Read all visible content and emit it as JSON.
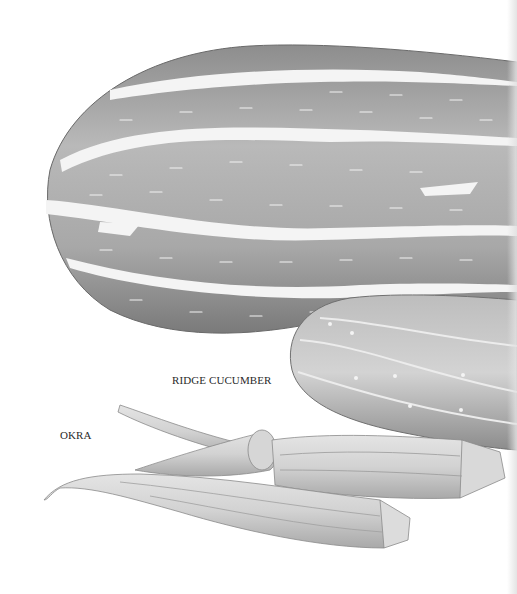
{
  "illustration": {
    "subjects": [
      "ridge-cucumber-large-striped-gourd",
      "ridge-cucumber-small",
      "okra-pods"
    ],
    "colors": {
      "background": "#ffffff",
      "gourd_body": "#a9a9a9",
      "gourd_shadow": "#6f6f6f",
      "stripe": "#f4f4f4",
      "okra": "#cfcfcf",
      "okra_line": "#8a8a8a"
    }
  },
  "captions": {
    "ridge_cucumber": "RIDGE CUCUMBER",
    "okra": "OKRA"
  }
}
